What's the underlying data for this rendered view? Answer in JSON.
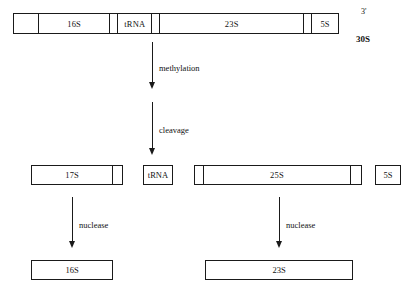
{
  "diagram": {
    "colors": {
      "stroke": "#1a1a1a",
      "background": "#ffffff",
      "text": "#111111"
    },
    "precursor": {
      "name": "30S precursor rRNA",
      "segments": [
        {
          "label": "",
          "name": "spacer-5prime"
        },
        {
          "label": "16S",
          "name": "segment-16s"
        },
        {
          "label": "",
          "name": "spacer-a"
        },
        {
          "label": "tRNA",
          "name": "segment-trna"
        },
        {
          "label": "",
          "name": "spacer-b"
        },
        {
          "label": "23S",
          "name": "segment-23s"
        },
        {
          "label": "",
          "name": "spacer-c"
        },
        {
          "label": "5S",
          "name": "segment-5s"
        }
      ]
    },
    "labels": {
      "three_prime": "3'",
      "precursor_size": "30S"
    },
    "steps": {
      "methylation": "methylation",
      "cleavage": "cleavage",
      "nuclease_left": "nuclease",
      "nuclease_right": "nuclease"
    },
    "intermediates": {
      "left": {
        "label": "17S",
        "name": "intermediate-17s"
      },
      "trna": {
        "label": "tRNA",
        "name": "intermediate-trna"
      },
      "right": {
        "label": "25S",
        "name": "intermediate-25s"
      },
      "five_s": {
        "label": "5S",
        "name": "intermediate-5s"
      }
    },
    "products": {
      "left": {
        "label": "16S",
        "name": "product-16s"
      },
      "right": {
        "label": "23S",
        "name": "product-23s"
      }
    }
  }
}
